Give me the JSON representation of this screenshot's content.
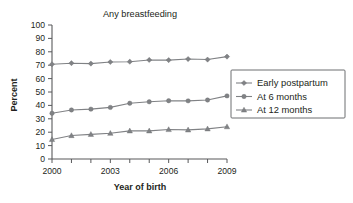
{
  "chart_data": {
    "type": "line",
    "title": "Any breastfeeding",
    "xlabel": "Year of birth",
    "ylabel": "Percent",
    "x": [
      2000,
      2001,
      2002,
      2003,
      2004,
      2005,
      2006,
      2007,
      2008,
      2009
    ],
    "xlim": [
      2000,
      2009
    ],
    "ylim": [
      0,
      100
    ],
    "yticks": [
      0,
      10,
      20,
      30,
      40,
      50,
      60,
      70,
      80,
      90,
      100
    ],
    "ytick_labels": [
      "0",
      "10",
      "20",
      "30",
      "40",
      "50",
      "60",
      "70",
      "80",
      "90",
      "100"
    ],
    "xticks": [
      2000,
      2001,
      2002,
      2003,
      2004,
      2005,
      2006,
      2007,
      2008,
      2009
    ],
    "xtick_labels": [
      "2000",
      "",
      "",
      "2003",
      "",
      "",
      "2006",
      "",
      "",
      "2009"
    ],
    "grid": false,
    "legend_position": "right",
    "series": [
      {
        "name": "Early postpartum",
        "marker": "diamond",
        "color": "#808285",
        "values": [
          70.7,
          71.5,
          71.2,
          72.4,
          72.6,
          73.9,
          73.8,
          74.6,
          74.2,
          76.4
        ]
      },
      {
        "name": "At 6 months",
        "marker": "circle",
        "color": "#808285",
        "values": [
          34.1,
          36.6,
          37.2,
          38.5,
          41.6,
          42.7,
          43.5,
          43.4,
          44.0,
          47.1
        ]
      },
      {
        "name": "At 12 months",
        "marker": "triangle",
        "color": "#808285",
        "values": [
          14.6,
          17.5,
          18.4,
          19.2,
          21.0,
          21.0,
          22.0,
          21.7,
          22.5,
          24.1
        ]
      }
    ]
  },
  "legend": {
    "entries": [
      {
        "label": "Early postpartum"
      },
      {
        "label": "At 6 months"
      },
      {
        "label": "At 12 months"
      }
    ]
  }
}
